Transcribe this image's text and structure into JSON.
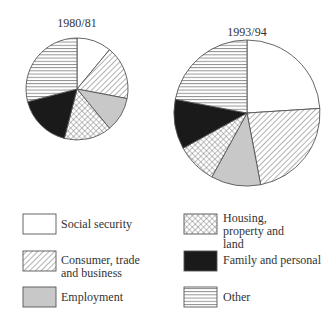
{
  "chart_data": [
    {
      "type": "pie",
      "title": "1980/81",
      "start_angle_deg": 0,
      "direction": "clockwise",
      "categories": [
        "Social security",
        "Consumer, trade and business",
        "Employment",
        "Housing, property and land",
        "Family and personal",
        "Other"
      ],
      "values": [
        11,
        17,
        11,
        15,
        17,
        29
      ],
      "unit": "percent (estimated)",
      "relative_size": "smaller"
    },
    {
      "type": "pie",
      "title": "1993/94",
      "start_angle_deg": 0,
      "direction": "clockwise",
      "categories": [
        "Social security",
        "Consumer, trade and business",
        "Employment",
        "Housing, property and land",
        "Family and personal",
        "Other"
      ],
      "values": [
        24,
        23,
        11,
        9,
        11,
        22
      ],
      "unit": "percent (estimated)",
      "relative_size": "larger"
    }
  ],
  "pies": [
    {
      "title": "1980/81",
      "cx": 77,
      "cy": 89,
      "r": 51,
      "values": [
        11,
        17,
        11,
        15,
        17,
        29
      ]
    },
    {
      "title": "1993/94",
      "cx": 247,
      "cy": 113,
      "r": 73,
      "values": [
        24,
        23,
        11,
        9,
        11,
        22
      ]
    }
  ],
  "legend": {
    "position": "bottom",
    "items": [
      {
        "label": "Social security",
        "pattern": "white"
      },
      {
        "label": "Consumer, trade and business",
        "pattern": "diagonal"
      },
      {
        "label": "Employment",
        "pattern": "grey"
      },
      {
        "label": "Housing, property and land",
        "pattern": "crosshatch"
      },
      {
        "label": "Family and personal",
        "pattern": "black"
      },
      {
        "label": "Other",
        "pattern": "horizontal"
      }
    ]
  },
  "colors": {
    "outline": "#555555",
    "grey_fill": "#c8c8c8",
    "black_fill": "#1a1a1a",
    "hatch_line": "#555555",
    "text": "#333333"
  }
}
